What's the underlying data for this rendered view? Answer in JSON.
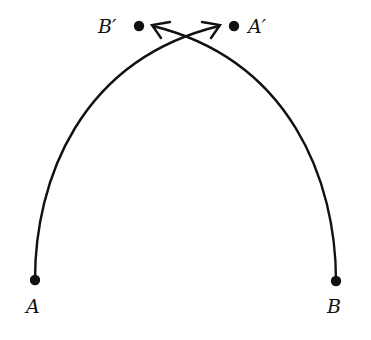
{
  "diagram": {
    "colors": {
      "stroke": "#111111",
      "background": "#ffffff"
    },
    "points": [
      {
        "id": "A",
        "label": "A",
        "x": 35,
        "y": 280
      },
      {
        "id": "B",
        "label": "B",
        "x": 336,
        "y": 281
      },
      {
        "id": "B_prime",
        "label": "B′",
        "x": 139,
        "y": 26
      },
      {
        "id": "A_prime",
        "label": "A′",
        "x": 234,
        "y": 26
      }
    ],
    "labels": {
      "A": "A",
      "B": "B",
      "B_prime": "B′",
      "A_prime": "A′"
    },
    "paths": [
      {
        "from": "A",
        "to": "A_prime",
        "shape": "curved-arrow"
      },
      {
        "from": "B",
        "to": "B_prime",
        "shape": "curved-arrow"
      }
    ]
  }
}
